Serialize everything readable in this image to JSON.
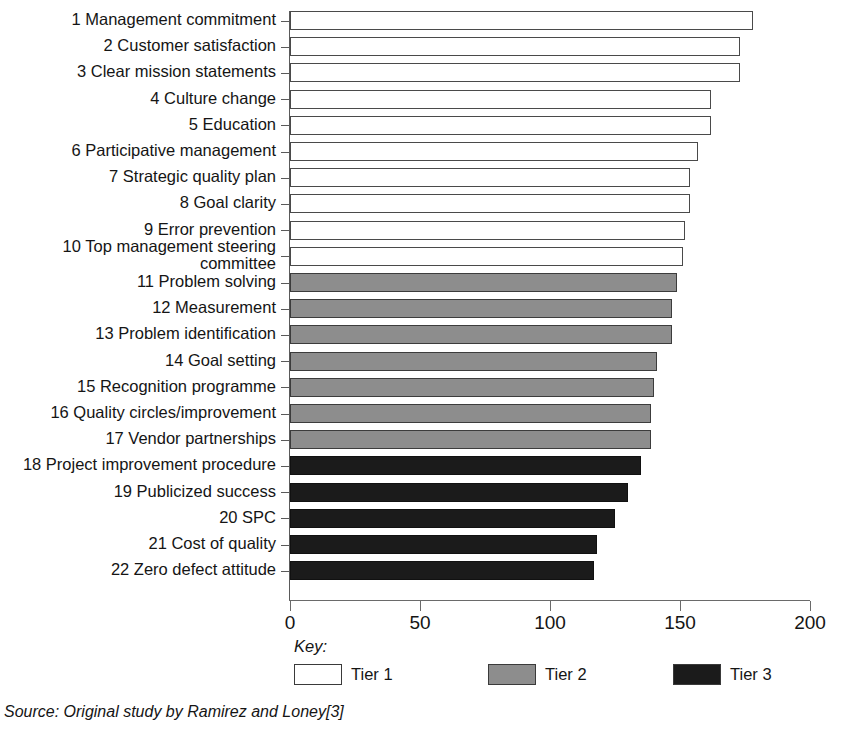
{
  "chart_data": {
    "type": "bar",
    "orientation": "horizontal",
    "title": "",
    "xlabel": "",
    "ylabel": "",
    "xlim": [
      0,
      200
    ],
    "xticks": [
      0,
      50,
      100,
      150,
      200
    ],
    "grid": false,
    "legend_position": "bottom",
    "legend_title": "Key:",
    "categories": [
      "1 Management commitment",
      "2 Customer satisfaction",
      "3 Clear mission statements",
      "4 Culture change",
      "5 Education",
      "6 Participative management",
      "7 Strategic quality plan",
      "8 Goal clarity",
      "9 Error prevention",
      "10 Top management steering\ncommittee",
      "11 Problem solving",
      "12 Measurement",
      "13 Problem identification",
      "14 Goal setting",
      "15 Recognition programme",
      "16 Quality circles/improvement",
      "17 Vendor partnerships",
      "18 Project improvement procedure",
      "19 Publicized success",
      "20 SPC",
      "21 Cost of quality",
      "22 Zero defect attitude"
    ],
    "values": [
      178,
      173,
      173,
      162,
      162,
      157,
      154,
      154,
      152,
      151,
      149,
      147,
      147,
      141,
      140,
      139,
      139,
      135,
      130,
      125,
      118,
      117
    ],
    "groups": [
      "Tier 1",
      "Tier 1",
      "Tier 1",
      "Tier 1",
      "Tier 1",
      "Tier 1",
      "Tier 1",
      "Tier 1",
      "Tier 1",
      "Tier 1",
      "Tier 2",
      "Tier 2",
      "Tier 2",
      "Tier 2",
      "Tier 2",
      "Tier 2",
      "Tier 2",
      "Tier 3",
      "Tier 3",
      "Tier 3",
      "Tier 3",
      "Tier 3"
    ],
    "series": [
      {
        "name": "Tier 1",
        "color": "#ffffff",
        "indices": [
          1,
          2,
          3,
          4,
          5,
          6,
          7,
          8,
          9,
          10
        ]
      },
      {
        "name": "Tier 2",
        "color": "#8d8d8d",
        "indices": [
          11,
          12,
          13,
          14,
          15,
          16,
          17
        ]
      },
      {
        "name": "Tier 3",
        "color": "#1b1b1b",
        "indices": [
          18,
          19,
          20,
          21,
          22
        ]
      }
    ]
  },
  "legend": {
    "title": "Key:",
    "items": [
      {
        "label": "Tier 1",
        "color": "#ffffff"
      },
      {
        "label": "Tier 2",
        "color": "#8d8d8d"
      },
      {
        "label": "Tier 3",
        "color": "#1b1b1b"
      }
    ]
  },
  "source": "Source: Original study by Ramirez and Loney[3]"
}
